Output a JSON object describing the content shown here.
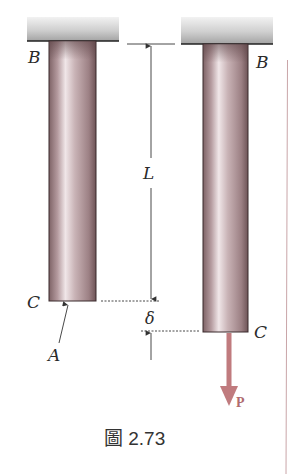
{
  "figure": {
    "caption": "圖 2.73",
    "labels": {
      "left_top": "B",
      "right_top": "B",
      "left_bottom": "C",
      "right_bottom": "C",
      "cross_section": "A",
      "length": "L",
      "elongation": "δ",
      "load": "P"
    },
    "colors": {
      "support_light": "#e6e6e6",
      "support_dark": "#a9a9a9",
      "bar_edge": "#3a2a2c",
      "bar_mid": "#b89ea2",
      "bar_highlight": "#efe4e6",
      "bar_shadow": "#7e6366",
      "load_arrow": "#c07b7e",
      "dimension_line": "#333333",
      "border_line": "#c9a5a8"
    }
  }
}
